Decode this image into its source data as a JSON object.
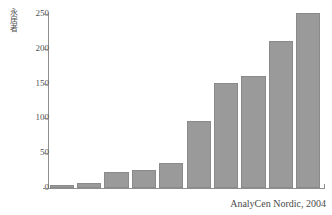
{
  "chart_data": {
    "type": "bar",
    "title": "",
    "subtitle": "",
    "xlabel": "",
    "ylabel": "永居者",
    "categories": [
      "1",
      "2",
      "3",
      "4",
      "5",
      "6",
      "7",
      "8",
      "9",
      "10"
    ],
    "values": [
      5,
      7,
      23,
      26,
      36,
      97,
      151,
      161,
      211,
      251
    ],
    "ylim": [
      0,
      250
    ],
    "yticks": [
      0,
      50,
      100,
      150,
      200,
      250
    ],
    "ytick_labels": [
      "0",
      "50",
      "100",
      "150",
      "200",
      "250"
    ],
    "xtick_labels": [],
    "grid": false,
    "legend": null,
    "legend_position": "none",
    "annotations": [
      {
        "name": "source-note",
        "text": "AnalyCen Nordic, 2004"
      }
    ],
    "colors": {
      "bar_fill": "#9a9a9a",
      "bar_stroke": "#8a8a8a",
      "axis": "#8e8e8e",
      "text": "#4a4a4a",
      "background": "#ffffff"
    }
  },
  "caption": {
    "source": "AnalyCen Nordic, 2004"
  }
}
